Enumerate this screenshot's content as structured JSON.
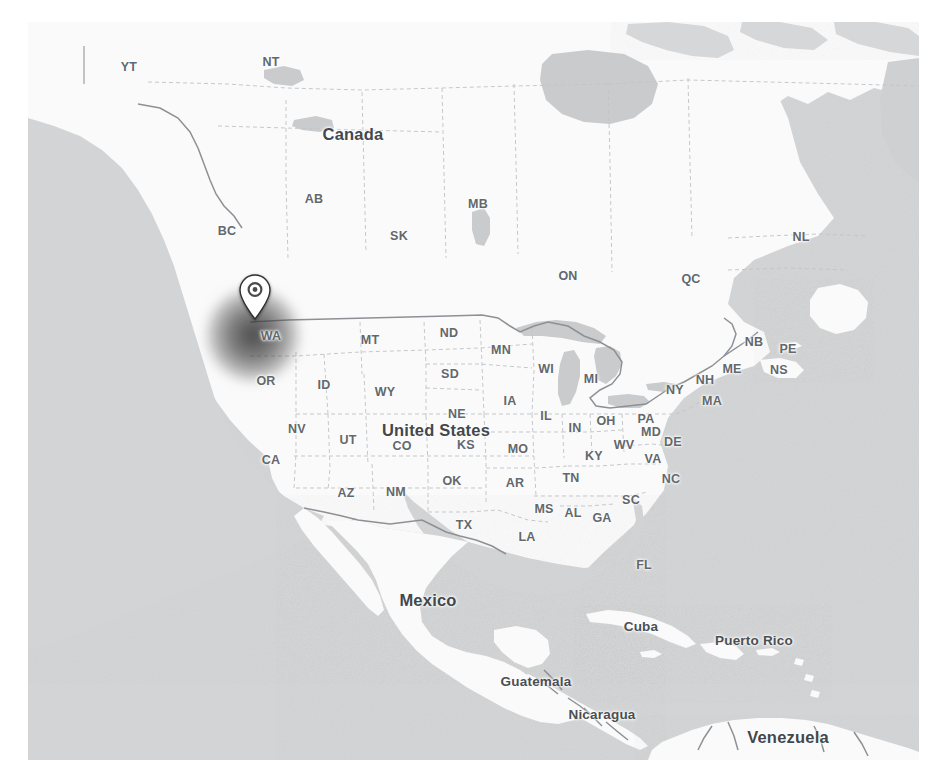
{
  "map": {
    "kind": "terrain-grayscale-map",
    "region": "North America and Caribbean",
    "colors": {
      "page_background": "#ffffff",
      "land": "#fafafa",
      "ocean": "#d3d4d5",
      "lake": "#c9cbcc",
      "border_country": "#8d9195",
      "border_state": "#c2c5c8",
      "label_state": "#62686d",
      "label_country": "#43484c",
      "pin_body": "#ffffff",
      "pin_inner": "#4a4a4a",
      "heat_blob": "#3a3a3a"
    },
    "marker": {
      "name": "location-pin",
      "tip_x": 227,
      "tip_y": 298,
      "over_state": "WA",
      "heat_blob_center_x": 225,
      "heat_blob_center_y": 313,
      "heat_blob_radius": 46
    },
    "country_labels": [
      {
        "text": "Canada",
        "x": 325,
        "y": 112,
        "size": "major"
      },
      {
        "text": "United States",
        "x": 408,
        "y": 408,
        "size": "major"
      },
      {
        "text": "Mexico",
        "x": 400,
        "y": 578,
        "size": "major"
      },
      {
        "text": "Venezuela",
        "x": 760,
        "y": 715,
        "size": "major"
      },
      {
        "text": "Cuba",
        "x": 613,
        "y": 604,
        "size": "mid"
      },
      {
        "text": "Puerto Rico",
        "x": 726,
        "y": 618,
        "size": "mid"
      },
      {
        "text": "Guatemala",
        "x": 508,
        "y": 659,
        "size": "mid"
      },
      {
        "text": "Nicaragua",
        "x": 574,
        "y": 692,
        "size": "mid"
      },
      {
        "text": "Guyana",
        "x": 800,
        "y": 747,
        "size": "small"
      }
    ],
    "province_labels": [
      {
        "text": "YT",
        "x": 101,
        "y": 45
      },
      {
        "text": "NT",
        "x": 243,
        "y": 40
      },
      {
        "text": "BC",
        "x": 199,
        "y": 209
      },
      {
        "text": "AB",
        "x": 286,
        "y": 177
      },
      {
        "text": "SK",
        "x": 371,
        "y": 214
      },
      {
        "text": "MB",
        "x": 450,
        "y": 182
      },
      {
        "text": "ON",
        "x": 540,
        "y": 254
      },
      {
        "text": "QC",
        "x": 663,
        "y": 257
      },
      {
        "text": "NL",
        "x": 773,
        "y": 215
      },
      {
        "text": "NB",
        "x": 726,
        "y": 320
      },
      {
        "text": "PE",
        "x": 760,
        "y": 327
      },
      {
        "text": "NS",
        "x": 751,
        "y": 348
      }
    ],
    "state_labels": [
      {
        "text": "WA",
        "x": 243,
        "y": 314
      },
      {
        "text": "MT",
        "x": 342,
        "y": 318
      },
      {
        "text": "ND",
        "x": 421,
        "y": 311
      },
      {
        "text": "OR",
        "x": 238,
        "y": 359
      },
      {
        "text": "ID",
        "x": 296,
        "y": 363
      },
      {
        "text": "SD",
        "x": 422,
        "y": 352
      },
      {
        "text": "MN",
        "x": 473,
        "y": 328
      },
      {
        "text": "WI",
        "x": 518,
        "y": 347
      },
      {
        "text": "MI",
        "x": 563,
        "y": 357
      },
      {
        "text": "WY",
        "x": 357,
        "y": 370
      },
      {
        "text": "NE",
        "x": 429,
        "y": 392
      },
      {
        "text": "IA",
        "x": 482,
        "y": 379
      },
      {
        "text": "IL",
        "x": 518,
        "y": 394
      },
      {
        "text": "IN",
        "x": 547,
        "y": 406
      },
      {
        "text": "OH",
        "x": 578,
        "y": 399
      },
      {
        "text": "PA",
        "x": 618,
        "y": 397
      },
      {
        "text": "NY",
        "x": 647,
        "y": 368
      },
      {
        "text": "NH",
        "x": 677,
        "y": 358
      },
      {
        "text": "ME",
        "x": 704,
        "y": 347
      },
      {
        "text": "MA",
        "x": 684,
        "y": 379
      },
      {
        "text": "MD",
        "x": 623,
        "y": 410
      },
      {
        "text": "DE",
        "x": 645,
        "y": 420
      },
      {
        "text": "NV",
        "x": 269,
        "y": 407
      },
      {
        "text": "UT",
        "x": 320,
        "y": 418
      },
      {
        "text": "CO",
        "x": 374,
        "y": 424
      },
      {
        "text": "KS",
        "x": 438,
        "y": 423
      },
      {
        "text": "MO",
        "x": 490,
        "y": 427
      },
      {
        "text": "KY",
        "x": 566,
        "y": 434
      },
      {
        "text": "WV",
        "x": 596,
        "y": 423
      },
      {
        "text": "VA",
        "x": 625,
        "y": 437
      },
      {
        "text": "CA",
        "x": 243,
        "y": 438
      },
      {
        "text": "AZ",
        "x": 318,
        "y": 471
      },
      {
        "text": "NM",
        "x": 368,
        "y": 470
      },
      {
        "text": "OK",
        "x": 424,
        "y": 459
      },
      {
        "text": "AR",
        "x": 487,
        "y": 461
      },
      {
        "text": "TN",
        "x": 543,
        "y": 456
      },
      {
        "text": "NC",
        "x": 643,
        "y": 457
      },
      {
        "text": "SC",
        "x": 603,
        "y": 478
      },
      {
        "text": "MS",
        "x": 516,
        "y": 487
      },
      {
        "text": "AL",
        "x": 545,
        "y": 491
      },
      {
        "text": "GA",
        "x": 574,
        "y": 496
      },
      {
        "text": "TX",
        "x": 436,
        "y": 503
      },
      {
        "text": "LA",
        "x": 499,
        "y": 515
      },
      {
        "text": "FL",
        "x": 616,
        "y": 543
      }
    ]
  }
}
